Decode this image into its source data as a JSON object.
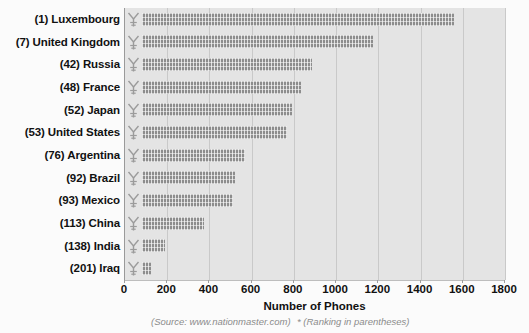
{
  "chart_data": {
    "type": "bar",
    "orientation": "horizontal",
    "title": "",
    "xlabel": "Number of Phones",
    "ylabel": "",
    "xlim": [
      0,
      1800
    ],
    "xticks": [
      0,
      200,
      400,
      600,
      800,
      1000,
      1200,
      1400,
      1600,
      1800
    ],
    "grid": true,
    "legend": false,
    "categories": [
      "(1) Luxembourg",
      "(7) United Kingdom",
      "(42) Russia",
      "(48) France",
      "(52) Japan",
      "(53) United States",
      "(76) Argentina",
      "(92) Brazil",
      "(93) Mexico",
      "(113) China",
      "(138) India",
      "(201) Iraq"
    ],
    "values": [
      1565,
      1160,
      850,
      795,
      750,
      725,
      515,
      465,
      455,
      310,
      115,
      45
    ],
    "annotations": [
      "(Source: www.nationmaster.com)",
      "* (Ranking in parentheses)"
    ],
    "bar_color": "#8d8d8d",
    "plot_background": "#e4e4e4",
    "grid_color": "#c9c9c9",
    "marker_icon": "antenna-tower-icon"
  },
  "footer": {
    "source": "(Source: www.nationmaster.com)",
    "ranking_note": "* (Ranking in parentheses)"
  }
}
